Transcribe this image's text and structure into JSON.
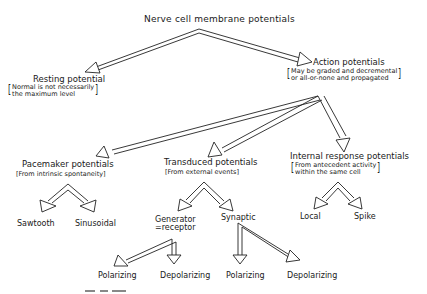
{
  "diagram": {
    "root": "Nerve cell membrane potentials",
    "nodes": {
      "resting": {
        "title": "Resting potential",
        "note_lines": [
          "Normal is not necessarily",
          "the maximum level"
        ]
      },
      "action": {
        "title": "Action potentials",
        "note_lines": [
          "May be graded and decremental",
          "or all-or-none and propagated"
        ]
      },
      "pacemaker": {
        "title": "Pacemaker potentials",
        "note": "[From intrinsic spontaneity]"
      },
      "transduced": {
        "title": "Transduced potentials",
        "note": "[From external events]"
      },
      "internal": {
        "title": "Internal response potentials",
        "note_lines": [
          "From antecedent activity",
          "within the same cell"
        ]
      },
      "sawtooth": "Sawtooth",
      "sinusoidal": "Sinusoidal",
      "generator": {
        "line1": "Generator",
        "line2": "=receptor"
      },
      "synaptic": "Synaptic",
      "local": "Local",
      "spike": "Spike",
      "gen_polarizing": "Polarizing",
      "gen_depolarizing": "Depolarizing",
      "syn_polarizing": "Polarizing",
      "syn_depolarizing": "Depolarizing"
    },
    "edges": [
      [
        "Nerve cell membrane potentials",
        "Resting potential"
      ],
      [
        "Nerve cell membrane potentials",
        "Action potentials"
      ],
      [
        "Action potentials",
        "Pacemaker potentials"
      ],
      [
        "Action potentials",
        "Transduced potentials"
      ],
      [
        "Action potentials",
        "Internal response potentials"
      ],
      [
        "Pacemaker potentials",
        "Sawtooth"
      ],
      [
        "Pacemaker potentials",
        "Sinusoidal"
      ],
      [
        "Transduced potentials",
        "Generator =receptor"
      ],
      [
        "Transduced potentials",
        "Synaptic"
      ],
      [
        "Internal response potentials",
        "Local"
      ],
      [
        "Internal response potentials",
        "Spike"
      ],
      [
        "Generator =receptor",
        "Polarizing"
      ],
      [
        "Generator =receptor",
        "Depolarizing"
      ],
      [
        "Synaptic",
        "Polarizing"
      ],
      [
        "Synaptic",
        "Depolarizing"
      ]
    ],
    "caption_partial": "Fig. 11."
  }
}
